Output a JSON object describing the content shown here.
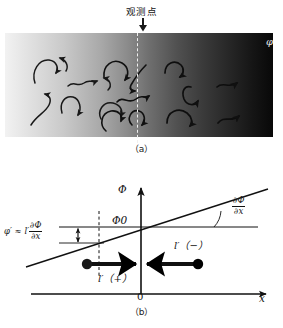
{
  "figure": {
    "panel_a": {
      "observation_point_label": "观测点",
      "field_symbol": "φ",
      "caption": "（a）",
      "gradient": {
        "direction": "left-to-right",
        "from_color": "#f2f2f2",
        "to_color": "#080808",
        "meaning": "scalar field Φ decreasing brightness with x"
      },
      "eddies_count": 17,
      "arrow_icon": "down-arrow"
    },
    "panel_b": {
      "caption": "（b）",
      "axis_y_label": "Φ",
      "axis_x_label": "x",
      "origin_label": "0",
      "mean_value_label": "Φ0",
      "slope_label": {
        "numerator": "∂Φ",
        "denominator": "∂x"
      },
      "fluctuation_label": {
        "lead": "φ′ ≈ l′",
        "numerator": "∂Φ",
        "denominator": "∂x"
      },
      "displacement_positive_label": "l′（+）",
      "displacement_negative_label": "l′（−）",
      "line_color": "#111111",
      "marker_color": "#000000"
    }
  }
}
